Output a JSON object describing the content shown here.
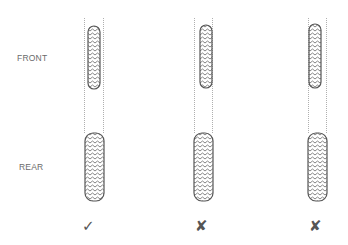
{
  "labels": {
    "front": "FRONT",
    "rear": "REAR"
  },
  "columns": [
    {
      "id": "aligned",
      "front_offset": "centered",
      "result": "correct",
      "mark": "✓",
      "mark_icon": "check-icon"
    },
    {
      "id": "offset-right",
      "front_offset": "right",
      "result": "incorrect",
      "mark": "✘",
      "mark_icon": "cross-icon"
    },
    {
      "id": "offset-left",
      "front_offset": "left",
      "result": "incorrect",
      "mark": "✘",
      "mark_icon": "cross-icon"
    }
  ],
  "colors": {
    "tire_outline": "#555555",
    "tread": "#666666",
    "guide_line": "#9a9a9a",
    "label": "#6a6a6a",
    "mark": "#555555"
  }
}
